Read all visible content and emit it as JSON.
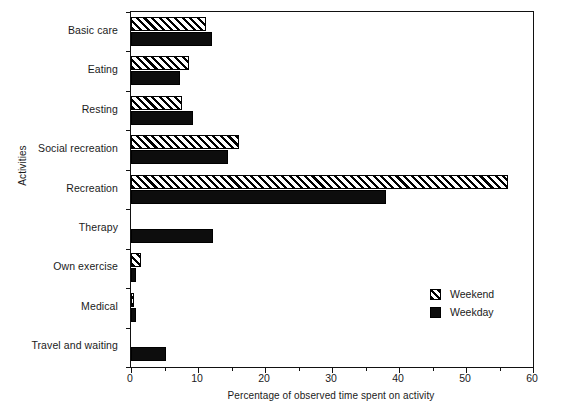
{
  "chart_data": {
    "type": "bar",
    "orientation": "horizontal",
    "title": "",
    "xlabel": "Percentage of observed time spent on activity",
    "ylabel": "Activities",
    "xlim": [
      0,
      60
    ],
    "grid": false,
    "legend_position": "center-right",
    "xticks": [
      0,
      10,
      20,
      30,
      40,
      50,
      60
    ],
    "xtick_labels": [
      "0",
      "10",
      "20",
      "30",
      "40",
      "50",
      "60"
    ],
    "minor_xticks": [
      5,
      15,
      25,
      35,
      45,
      55
    ],
    "categories": [
      "Basic care",
      "Eating",
      "Resting",
      "Social recreation",
      "Recreation",
      "Therapy",
      "Own exercise",
      "Medical",
      "Travel and waiting"
    ],
    "series": [
      {
        "name": "Weekend",
        "pattern": "diagonal-hatch",
        "color": "#000000",
        "values": [
          11.2,
          8.7,
          7.6,
          16.1,
          56.2,
          0.0,
          1.5,
          0.4,
          0.0
        ]
      },
      {
        "name": "Weekday",
        "pattern": "solid",
        "color": "#0d0d0d",
        "values": [
          12.1,
          7.3,
          9.2,
          14.5,
          38.1,
          12.2,
          0.7,
          0.8,
          5.2
        ]
      }
    ]
  },
  "legend": {
    "items": [
      {
        "label": "Weekend"
      },
      {
        "label": "Weekday"
      }
    ]
  }
}
